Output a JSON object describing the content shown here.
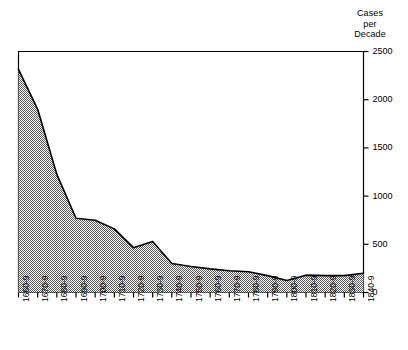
{
  "chart_data": {
    "type": "area",
    "title": "",
    "axis_title_lines": [
      "Cases",
      "per",
      "Decade"
    ],
    "axis_title": "Cases per Decade",
    "xlabel": "",
    "ylabel": "Cases per Decade",
    "categories": [
      "1660-9",
      "1670-9",
      "1680-9",
      "1690-9",
      "1700-9",
      "1710-9",
      "1720-9",
      "1730-9",
      "1740-9",
      "1750-9",
      "1760-9",
      "1770-9",
      "1780-9",
      "1790-9",
      "1800-9",
      "1810-9",
      "1820-9",
      "1830-9",
      "1840-9"
    ],
    "values": [
      2315,
      1900,
      1225,
      770,
      750,
      660,
      465,
      530,
      300,
      270,
      245,
      225,
      215,
      175,
      125,
      180,
      175,
      175,
      200
    ],
    "ylim": [
      0,
      2500
    ],
    "yticks": [
      0,
      500,
      1000,
      1500,
      2000,
      2500
    ],
    "ytick_labels": [
      "0",
      "500",
      "1000",
      "1500",
      "2000",
      "2500"
    ],
    "grid": false,
    "legend": null,
    "y_axis_position": "right",
    "fill_color": "#9a9a9a",
    "line_color": "#000000",
    "background_color": "#ffffff"
  },
  "figure": {
    "width": 408,
    "height": 350
  }
}
